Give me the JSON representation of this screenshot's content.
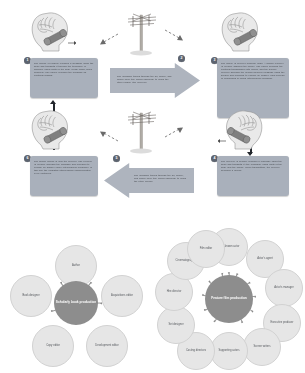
{
  "figure_top": {
    "title": "mediated communication process cycle",
    "steps": [
      {
        "number": "1",
        "text": "The source (a person) encodes a message using the brain and transmits it through the telephone (a medium) using parts of the body (vocal cords, facial muscles). The phone encodes the message as electrical signals."
      },
      {
        "number": "2",
        "text": "The message travels through the air, phone, and phone lines (the media channels) to reach the other person (the receiver)."
      },
      {
        "number": "3",
        "text": "The phone (a receiver medium) rings. A human receiver (a person) answers the phone. The phone decodes the electrical transmission into sound, and the human receiver decodes the human source's message using the senses and prepares to encode an answer. This process of responding is called interpersonal feedback."
      },
      {
        "number": "4",
        "text": "The receiver (a person) encodes a response using the brain and transmits it (the feedback) using parts of the body and the phone. When transmitting, the receiver becomes a source."
      },
      {
        "number": "5",
        "text": "The message travels through the air, phone, and phone lines (the media channels) to reach the other person."
      },
      {
        "number": "6",
        "text": "The former source is now the receiver. The receiver (a person) decodes the message and prepares to encode an answer (more interpersonal feedback). In this way the mediated interpersonal communication cycle continues."
      }
    ],
    "illustrations": [
      {
        "name": "head-brain-phone-left-top",
        "label": "person with brain speaking into telephone handset"
      },
      {
        "name": "telephone-pole-top",
        "label": "telephone pole with wires carrying signal"
      },
      {
        "name": "head-brain-phone-right-top",
        "label": "person with brain listening to telephone handset"
      },
      {
        "name": "head-brain-phone-left-bottom",
        "label": "person with brain listening to telephone handset"
      },
      {
        "name": "telephone-pole-bottom",
        "label": "telephone pole with wires carrying signal"
      },
      {
        "name": "head-brain-phone-right-bottom",
        "label": "person with brain speaking into telephone handset"
      }
    ]
  },
  "figure_bottom": {
    "diagrams": [
      {
        "name": "scholarly-book-production",
        "hub": "Scholarly book production",
        "nodes": [
          "Author",
          "Acquisitions editor",
          "Development editor",
          "Copy editor",
          "Book designer"
        ]
      },
      {
        "name": "feature-film-production",
        "hub": "Feature film production",
        "nodes": [
          "Well-known actor",
          "Actor's agent",
          "Actor's manager",
          "Executive producer",
          "Screen writers",
          "Supporting actors",
          "Casting directors",
          "Set designer",
          "Hire director",
          "Cinematographer",
          "Film editor"
        ]
      }
    ]
  },
  "colors": {
    "callout_bg": "#a9b0bb",
    "badge_bg": "#5d6470",
    "hub_bg": "#8d8d8d",
    "node_bg": "#e6e6e6",
    "connector": "#22262c",
    "page_bg": "#ffffff"
  }
}
